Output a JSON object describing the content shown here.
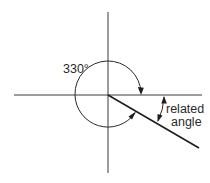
{
  "diagram": {
    "type": "angle-in-standard-position",
    "angle_label": "330°",
    "angle_degrees": 330,
    "related_angle_label_line1": "related",
    "related_angle_label_line2": "angle",
    "related_angle_degrees": 30,
    "origin": [
      108,
      95
    ],
    "colors": {
      "background": "#ffffff",
      "lines": "#2a2a2a",
      "text": "#2a2a2a"
    }
  }
}
